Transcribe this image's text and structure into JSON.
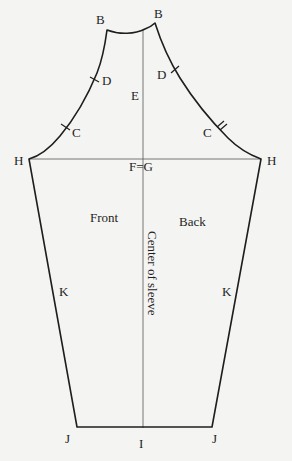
{
  "diagram": {
    "type": "sleeve-pattern",
    "colors": {
      "background": "#f4f4f2",
      "outline": "#1e1e1e",
      "guide": "#555555"
    },
    "labels": {
      "B_left": "B",
      "B_right": "B",
      "D_left": "D",
      "D_right": "D",
      "E": "E",
      "C_left": "C",
      "C_right": "C",
      "H_left": "H",
      "H_right": "H",
      "FG": "F=G",
      "front": "Front",
      "back": "Back",
      "center": "Center of sleeve",
      "K_left": "K",
      "K_right": "K",
      "J_left": "J",
      "J_right": "J",
      "I": "I"
    },
    "notches": {
      "front_D": "single",
      "front_C": "single",
      "back_D": "single",
      "back_C": "double"
    }
  }
}
